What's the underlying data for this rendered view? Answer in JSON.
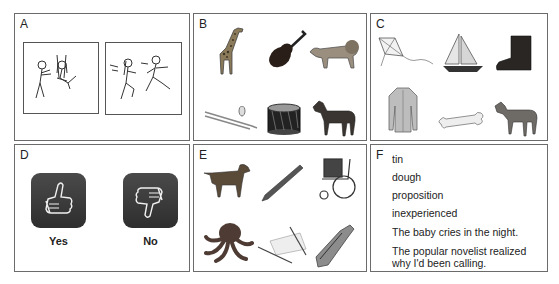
{
  "panels": {
    "a": {
      "letter": "A",
      "pictures": [
        {
          "icon": "swing-scene-icon",
          "description": "boy pushing girl on a swing"
        },
        {
          "icon": "running-scene-icon",
          "description": "girl and boy running"
        }
      ]
    },
    "b": {
      "letter": "B",
      "items": [
        "giraffe",
        "violin",
        "lion",
        "trombone",
        "drum",
        "horse"
      ]
    },
    "c": {
      "letter": "C",
      "items": [
        "kite",
        "sailboat",
        "boot",
        "coat",
        "bone",
        "goat"
      ]
    },
    "d": {
      "letter": "D",
      "options": [
        {
          "icon": "thumbs-up-icon",
          "label": "Yes"
        },
        {
          "icon": "thumbs-down-icon",
          "label": "No"
        }
      ]
    },
    "e": {
      "letter": "E",
      "items": [
        "dog",
        "pencil",
        "wheelchair",
        "octopus",
        "hammock",
        "escalator"
      ]
    },
    "f": {
      "letter": "F",
      "lines": [
        "tin",
        "dough",
        "proposition",
        "inexperienced",
        "The baby cries in the night.",
        "The popular novelist realized",
        "why I'd been calling."
      ]
    }
  }
}
